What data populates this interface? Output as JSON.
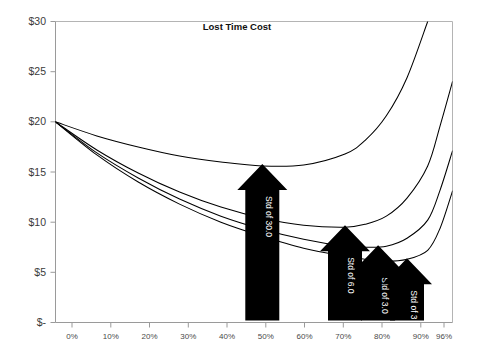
{
  "chart_data": {
    "type": "line",
    "title": "Lost Time Cost",
    "xlabel": "",
    "ylabel": "",
    "grid": false,
    "legend_position": "none",
    "xlim": [
      0,
      96
    ],
    "ylim": [
      0,
      30
    ],
    "x_tick_labels": [
      "0%",
      "10%",
      "20%",
      "30%",
      "40%",
      "50%",
      "60%",
      "70%",
      "80%",
      "90%",
      "96%"
    ],
    "x_tick_values": [
      0,
      10,
      20,
      30,
      40,
      50,
      60,
      70,
      80,
      90,
      96
    ],
    "y_tick_labels": [
      "$-",
      "$5",
      "$10",
      "$15",
      "$20",
      "$25",
      "$30"
    ],
    "y_tick_values": [
      0,
      5,
      10,
      15,
      20,
      25,
      30
    ],
    "x": [
      0,
      10,
      20,
      30,
      40,
      50,
      60,
      70,
      75,
      80,
      85,
      90,
      93,
      96
    ],
    "series": [
      {
        "name": "Std of 30.0",
        "values": [
          20.0,
          18.6,
          17.5,
          16.6,
          16.0,
          15.6,
          15.7,
          16.8,
          18.2,
          20.6,
          24.4,
          30.0,
          null,
          null
        ]
      },
      {
        "name": "Std of 6.0",
        "values": [
          20.0,
          17.2,
          14.9,
          13.0,
          11.5,
          10.4,
          9.7,
          9.5,
          9.8,
          10.6,
          12.4,
          15.6,
          19.6,
          24.0
        ]
      },
      {
        "name": "Std of 3.0",
        "values": [
          20.0,
          16.9,
          14.4,
          12.3,
          10.6,
          9.3,
          8.3,
          7.6,
          7.5,
          7.6,
          8.4,
          10.2,
          13.2,
          17.1
        ]
      },
      {
        "name": "Std of 3",
        "values": [
          20.0,
          16.7,
          14.0,
          11.8,
          10.0,
          8.6,
          7.4,
          6.6,
          6.3,
          6.1,
          6.3,
          7.2,
          9.4,
          13.1
        ]
      }
    ],
    "annotations": [
      {
        "label": "Std of 30.0",
        "points_to_x": 50,
        "points_to_y": 15.6
      },
      {
        "label": "Std of 6.0",
        "points_to_x": 70,
        "points_to_y": 9.5
      },
      {
        "label": "Std of 3.0",
        "points_to_x": 78,
        "points_to_y": 7.5
      },
      {
        "label": "Std of 3",
        "points_to_x": 85,
        "points_to_y": 6.2
      }
    ]
  },
  "colors": {
    "series_stroke": "#000000",
    "annotation_fill": "#000000",
    "annotation_text": "#ffffff",
    "axis": "#9a9a9a",
    "background": "#ffffff",
    "tick_text": "#4a4a4a"
  }
}
